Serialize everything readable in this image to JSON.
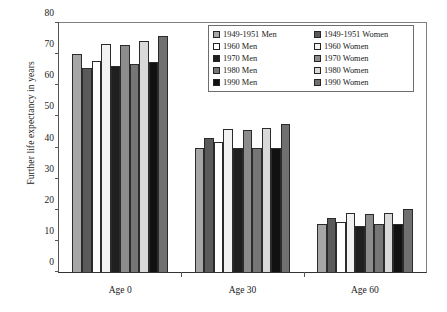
{
  "chart_data": {
    "type": "bar",
    "title": "",
    "xlabel": "",
    "ylabel": "Further life expectancy in years",
    "categories": [
      "Age 0",
      "Age 30",
      "Age 60"
    ],
    "ylim": [
      0,
      80
    ],
    "yticks": [
      0,
      10,
      20,
      30,
      40,
      50,
      60,
      70,
      80
    ],
    "grid": false,
    "legend_position": "top-right",
    "series": [
      {
        "name": "1949-1951 Men",
        "color": "#a6a6a6",
        "values": [
          70.0,
          39.7,
          15.5
        ]
      },
      {
        "name": "1949-1951 Women",
        "color": "#5a5a5a",
        "values": [
          65.5,
          43.1,
          17.3
        ]
      },
      {
        "name": "1960 Men",
        "color": "#ffffff",
        "values": [
          67.8,
          41.8,
          16.2
        ]
      },
      {
        "name": "1960 Women",
        "color": "#f2f2f2",
        "values": [
          73.2,
          46.0,
          19.0
        ]
      },
      {
        "name": "1970 Men",
        "color": "#1f1f1f",
        "values": [
          66.2,
          39.7,
          14.9
        ]
      },
      {
        "name": "1970 Women",
        "color": "#8c8c8c",
        "values": [
          73.0,
          45.6,
          18.5
        ]
      },
      {
        "name": "1980 Men",
        "color": "#767676",
        "values": [
          66.9,
          39.7,
          15.3
        ]
      },
      {
        "name": "1980 Women",
        "color": "#d9d9d9",
        "values": [
          74.1,
          46.3,
          19.0
        ]
      },
      {
        "name": "1990 Men",
        "color": "#111111",
        "values": [
          67.5,
          39.7,
          15.5
        ]
      },
      {
        "name": "1990 Women",
        "color": "#707070",
        "values": [
          75.9,
          47.5,
          20.1
        ]
      }
    ]
  }
}
